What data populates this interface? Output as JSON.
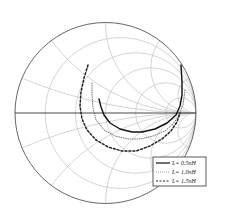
{
  "chart_data": {
    "type": "smith",
    "title": "",
    "grid": {
      "resistance_circles": [
        0.2,
        0.5,
        1,
        2,
        5
      ],
      "reactance_arcs": [
        0.2,
        0.5,
        1,
        2,
        5,
        -0.2,
        -0.5,
        -1,
        -2,
        -5
      ]
    },
    "series": [
      {
        "name": "L= 0.5nH",
        "style": "solid",
        "color": "#111111",
        "points_px": [
          [
            99,
            99
          ],
          [
            101,
            107
          ],
          [
            104,
            115
          ],
          [
            110,
            123
          ],
          [
            120,
            129
          ],
          [
            132,
            132
          ],
          [
            142,
            132
          ],
          [
            155,
            129
          ],
          [
            167,
            123
          ],
          [
            176,
            115
          ],
          [
            180,
            106
          ],
          [
            182,
            95
          ],
          [
            182,
            82
          ],
          [
            181,
            65
          ]
        ]
      },
      {
        "name": "L= 1.0nH",
        "style": "dotted",
        "color": "#555555",
        "points_px": [
          [
            92,
            83
          ],
          [
            92,
            95
          ],
          [
            93,
            108
          ],
          [
            96,
            120
          ],
          [
            104,
            130
          ],
          [
            115,
            136
          ],
          [
            128,
            139
          ],
          [
            140,
            139
          ],
          [
            153,
            136
          ],
          [
            165,
            131
          ],
          [
            173,
            124
          ],
          [
            178,
            117
          ],
          [
            183,
            105
          ],
          [
            185,
            90
          ]
        ]
      },
      {
        "name": "L= 1.5nH",
        "style": "dashed",
        "color": "#222222",
        "points_px": [
          [
            88,
            65
          ],
          [
            84,
            78
          ],
          [
            81,
            92
          ],
          [
            80,
            106
          ],
          [
            82,
            119
          ],
          [
            87,
            130
          ],
          [
            96,
            140
          ],
          [
            108,
            147
          ],
          [
            122,
            151
          ],
          [
            136,
            151
          ],
          [
            150,
            146
          ],
          [
            162,
            139
          ],
          [
            171,
            131
          ],
          [
            177,
            122
          ],
          [
            180,
            113
          ]
        ]
      }
    ],
    "legend": {
      "position": "lower-right",
      "entries": [
        "L= 0.5nH",
        "L= 1.0nH",
        "L= 1.5nH"
      ]
    }
  },
  "legend": {
    "items": [
      {
        "label": "L= 0.5nH"
      },
      {
        "label": "L= 1.0nH"
      },
      {
        "label": "L= 1.5nH"
      }
    ]
  }
}
